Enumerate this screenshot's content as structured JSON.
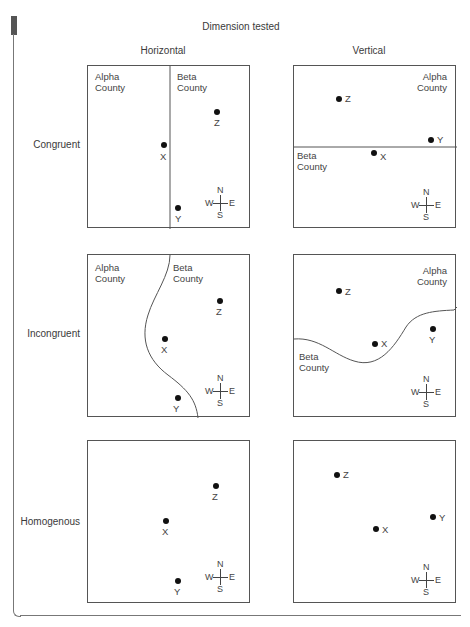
{
  "figure": {
    "title": "Dimension tested",
    "columns": [
      {
        "label": "Horizontal"
      },
      {
        "label": "Vertical"
      }
    ],
    "rows": [
      {
        "label": "Congruent"
      },
      {
        "label": "Incongruent"
      },
      {
        "label": "Homogenous"
      }
    ],
    "region_labels": {
      "alpha_line1": "Alpha",
      "alpha_line2": "County",
      "beta_line1": "Beta",
      "beta_line2": "County"
    },
    "points": {
      "x": "X",
      "y": "Y",
      "z": "Z"
    },
    "compass": {
      "n": "N",
      "s": "S",
      "e": "E",
      "w": "W"
    },
    "colors": {
      "line": "#555555",
      "dot": "#111111",
      "text": "#444444"
    }
  },
  "panels": [
    {
      "row": "Congruent",
      "column": "Horizontal",
      "boundary": "straight vertical",
      "points": {
        "X": [
          76,
          79
        ],
        "Y": [
          90,
          142
        ],
        "Z": [
          96,
          46
        ]
      }
    },
    {
      "row": "Congruent",
      "column": "Vertical",
      "boundary": "straight horizontal",
      "points": {
        "X": [
          80,
          87
        ],
        "Y": [
          138,
          74
        ],
        "Z": [
          45,
          33
        ]
      }
    },
    {
      "row": "Incongruent",
      "column": "Horizontal",
      "boundary": "curved vertical",
      "points": {
        "X": [
          77,
          84
        ],
        "Y": [
          91,
          143
        ],
        "Z": [
          132,
          46
        ]
      }
    },
    {
      "row": "Incongruent",
      "column": "Vertical",
      "boundary": "curved horizontal",
      "points": {
        "X": [
          80,
          89
        ],
        "Y": [
          139,
          75
        ],
        "Z": [
          45,
          36
        ]
      }
    },
    {
      "row": "Homogenous",
      "column": "Horizontal",
      "boundary": "none",
      "points": {
        "X": [
          78,
          80
        ],
        "Y": [
          90,
          140
        ],
        "Z": [
          128,
          45
        ]
      }
    },
    {
      "row": "Homogenous",
      "column": "Vertical",
      "boundary": "none",
      "points": {
        "X": [
          82,
          88
        ],
        "Y": [
          139,
          76
        ],
        "Z": [
          43,
          34
        ]
      }
    }
  ]
}
